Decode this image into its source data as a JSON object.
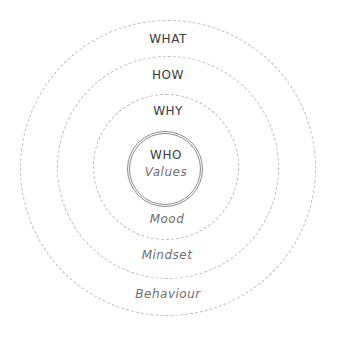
{
  "diagram": {
    "type": "concentric-circles",
    "rings": [
      {
        "id": "outer",
        "top_label": "WHAT",
        "bottom_label": "Behaviour"
      },
      {
        "id": "second",
        "top_label": "HOW",
        "bottom_label": "Mindset"
      },
      {
        "id": "third",
        "top_label": "WHY",
        "bottom_label": "Mood"
      },
      {
        "id": "core",
        "top_label": "WHO",
        "bottom_label": "Values"
      }
    ],
    "colors": {
      "ring_stroke": "#b9b9b9",
      "core_stroke": "#8a8a8a",
      "top_text": "#3a3a3a",
      "bottom_text": "#6f6f6f",
      "background": "#ffffff"
    }
  }
}
